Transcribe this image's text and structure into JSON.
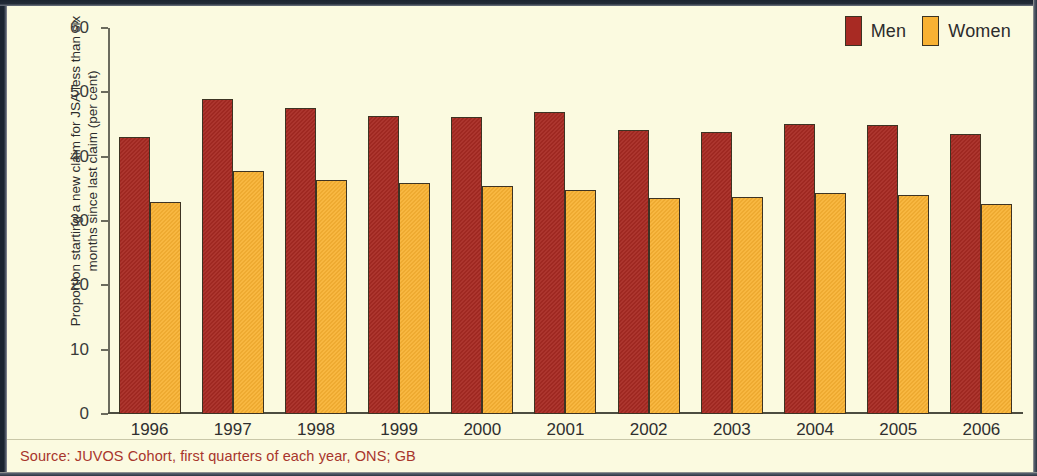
{
  "figure": {
    "background_color": "#fbfae0",
    "frame_color": "#1b2430",
    "source_note": "Source: JUVOS Cohort, first quarters of each year, ONS; GB",
    "source_color": "#a8352c"
  },
  "legend": {
    "position": "top-right",
    "items": [
      {
        "label": "Men",
        "color": "#a82a23"
      },
      {
        "label": "Women",
        "color": "#f8b133"
      }
    ]
  },
  "axis": {
    "y_title": "Proportion starting a new claim for JSA less than six months since last claim (per cent)",
    "y_ticks": [
      "0",
      "10",
      "20",
      "30",
      "40",
      "50",
      "60"
    ]
  },
  "chart_data": {
    "type": "bar",
    "title": "",
    "subtitle": "",
    "xlabel": "",
    "ylabel": "Proportion starting a new claim for JSA less than six months since last claim (per cent)",
    "ylim": [
      0,
      60
    ],
    "ytick_step": 10,
    "grid": false,
    "legend_position": "top-right",
    "categories": [
      "1996",
      "1997",
      "1998",
      "1999",
      "2000",
      "2001",
      "2002",
      "2003",
      "2004",
      "2005",
      "2006"
    ],
    "series": [
      {
        "name": "Men",
        "color": "#a82a23",
        "values": [
          43.0,
          49.0,
          47.6,
          46.4,
          46.2,
          47.0,
          44.2,
          43.8,
          45.1,
          44.9,
          43.6
        ]
      },
      {
        "name": "Women",
        "color": "#f8b133",
        "values": [
          33.0,
          37.8,
          36.3,
          35.9,
          35.4,
          34.8,
          33.6,
          33.7,
          34.3,
          34.0,
          32.6
        ]
      }
    ],
    "annotations": [
      "Source: JUVOS Cohort, first quarters of each year, ONS; GB"
    ]
  }
}
